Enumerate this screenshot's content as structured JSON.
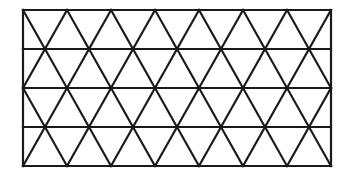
{
  "diagram": {
    "type": "triangular-lattice",
    "stroke_color": "#1a1a1a",
    "background": "#ffffff",
    "stroke_width": 2.2,
    "bounds": {
      "x": 23,
      "y": 10,
      "width": 308,
      "height": 156
    },
    "rows": 4,
    "columns": 7
  }
}
